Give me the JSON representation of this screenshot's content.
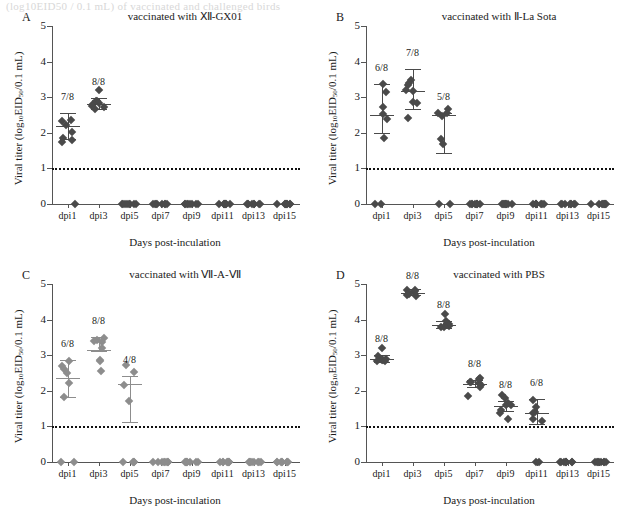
{
  "figure": {
    "caption_strip": "(log10EID50 / 0.1 mL) of vaccinated and challenged birds",
    "width": 628,
    "height": 523
  },
  "axes": {
    "ylabel_prefix": "Viral titer (log",
    "ylabel_sub1": "10",
    "ylabel_mid": "EID",
    "ylabel_sub2": "50",
    "ylabel_suffix": "/0.1 mL)",
    "ylabel_full": "Viral titer (log10EID50/0.1 mL)",
    "xlabel": "Days post-inculation",
    "y_ticks": [
      "0",
      "1",
      "2",
      "3",
      "4",
      "5"
    ],
    "y_min": 0,
    "y_max": 5,
    "x_categories": [
      "dpi1",
      "dpi3",
      "dpi5",
      "dpi7",
      "dpi9",
      "dpi11",
      "dpi13",
      "dpi15"
    ],
    "threshold_value": 1,
    "threshold_style": "dotted"
  },
  "colors": {
    "axis": "#555555",
    "threshold": "#111111",
    "marker_dark": "#4a4a4a",
    "marker_light": "#8d8d8d",
    "text": "#1a1a1a"
  },
  "chart_data": {
    "type": "scatter",
    "xlabel": "Days post-inculation",
    "ylabel": "Viral titer (log10EID50/0.1 mL)",
    "ylim": [
      0,
      5
    ],
    "grid": false,
    "legend": "none",
    "x_categories": [
      "dpi1",
      "dpi3",
      "dpi5",
      "dpi7",
      "dpi9",
      "dpi11",
      "dpi13",
      "dpi15"
    ],
    "threshold_line": {
      "value": 1,
      "style": "dotted",
      "label": "limit of detection"
    },
    "panels": [
      {
        "letter": "A",
        "title": "vaccinated with Ⅻ-GX01",
        "marker_color": "#4a4a4a",
        "groups": [
          {
            "x": "dpi1",
            "n_positive_label": "7/8",
            "mean": 2.18,
            "err_low": 1.82,
            "err_high": 2.56,
            "values": [
              2.38,
              2.35,
              2.18,
              2.0,
              1.85,
              1.83,
              1.72,
              0.0
            ]
          },
          {
            "x": "dpi3",
            "n_positive_label": "8/8",
            "mean": 2.82,
            "err_low": 2.68,
            "err_high": 2.98,
            "values": [
              3.18,
              2.88,
              2.86,
              2.84,
              2.8,
              2.78,
              2.72,
              2.68
            ]
          },
          {
            "x": "dpi5",
            "n_positive_label": "",
            "values": [
              0,
              0,
              0,
              0,
              0,
              0,
              0,
              0
            ]
          },
          {
            "x": "dpi7",
            "n_positive_label": "",
            "values": [
              0,
              0,
              0,
              0,
              0,
              0,
              0,
              0
            ]
          },
          {
            "x": "dpi9",
            "n_positive_label": "",
            "values": [
              0,
              0,
              0,
              0,
              0,
              0,
              0,
              0
            ]
          },
          {
            "x": "dpi11",
            "n_positive_label": "",
            "values": [
              0,
              0,
              0,
              0,
              0,
              0,
              0,
              0
            ]
          },
          {
            "x": "dpi13",
            "n_positive_label": "",
            "values": [
              0,
              0,
              0,
              0,
              0,
              0,
              0,
              0
            ]
          },
          {
            "x": "dpi15",
            "n_positive_label": "",
            "values": [
              0,
              0,
              0,
              0,
              0,
              0,
              0,
              0
            ]
          }
        ]
      },
      {
        "letter": "B",
        "title": "vaccinated with Ⅱ-La Sota",
        "marker_color": "#4a4a4a",
        "groups": [
          {
            "x": "dpi1",
            "n_positive_label": "6/8",
            "mean": 2.5,
            "err_low": 2.0,
            "err_high": 3.38,
            "values": [
              3.38,
              3.18,
              2.7,
              2.52,
              2.4,
              1.85,
              0.0,
              0.0
            ]
          },
          {
            "x": "dpi3",
            "n_positive_label": "7/8",
            "mean": 3.18,
            "err_low": 2.67,
            "err_high": 3.8,
            "values": [
              3.5,
              3.38,
              3.33,
              3.22,
              3.18,
              2.86,
              2.84,
              2.4
            ]
          },
          {
            "x": "dpi5",
            "n_positive_label": "5/8",
            "mean": 2.5,
            "err_low": 1.42,
            "err_high": 2.56,
            "values": [
              2.7,
              2.55,
              2.52,
              2.5,
              1.85,
              1.7,
              0.0,
              0.0
            ]
          },
          {
            "x": "dpi7",
            "n_positive_label": "",
            "values": [
              0,
              0,
              0,
              0,
              0,
              0,
              0,
              0
            ]
          },
          {
            "x": "dpi9",
            "n_positive_label": "",
            "values": [
              0,
              0,
              0,
              0,
              0,
              0,
              0,
              0
            ]
          },
          {
            "x": "dpi11",
            "n_positive_label": "",
            "values": [
              0,
              0,
              0,
              0,
              0,
              0,
              0,
              0
            ]
          },
          {
            "x": "dpi13",
            "n_positive_label": "",
            "values": [
              0,
              0,
              0,
              0,
              0,
              0,
              0,
              0
            ]
          },
          {
            "x": "dpi15",
            "n_positive_label": "",
            "values": [
              0,
              0,
              0,
              0,
              0,
              0,
              0,
              0
            ]
          }
        ]
      },
      {
        "letter": "C",
        "title": "vaccinated with Ⅶ-A-Ⅶ",
        "marker_color": "#8d8d8d",
        "groups": [
          {
            "x": "dpi1",
            "n_positive_label": "6/8",
            "mean": 2.35,
            "err_low": 1.83,
            "err_high": 2.86,
            "values": [
              2.86,
              2.7,
              2.63,
              2.48,
              2.2,
              1.85,
              0.0,
              0.0
            ]
          },
          {
            "x": "dpi3",
            "n_positive_label": "8/8",
            "mean": 3.15,
            "err_low": 3.12,
            "err_high": 3.5,
            "values": [
              3.5,
              3.45,
              3.42,
              3.38,
              3.2,
              2.88,
              2.85,
              2.52
            ]
          },
          {
            "x": "dpi5",
            "n_positive_label": "4/8",
            "mean": 2.2,
            "err_low": 1.13,
            "err_high": 2.42,
            "values": [
              2.72,
              2.52,
              2.2,
              1.7,
              0.0,
              0.0,
              0.0,
              0.0
            ]
          },
          {
            "x": "dpi7",
            "n_positive_label": "",
            "values": [
              0,
              0,
              0,
              0,
              0,
              0,
              0,
              0
            ]
          },
          {
            "x": "dpi9",
            "n_positive_label": "",
            "values": [
              0,
              0,
              0,
              0,
              0,
              0,
              0,
              0
            ]
          },
          {
            "x": "dpi11",
            "n_positive_label": "",
            "values": [
              0,
              0,
              0,
              0,
              0,
              0,
              0,
              0
            ]
          },
          {
            "x": "dpi13",
            "n_positive_label": "",
            "values": [
              0,
              0,
              0,
              0,
              0,
              0,
              0,
              0
            ]
          },
          {
            "x": "dpi15",
            "n_positive_label": "",
            "values": [
              0,
              0,
              0,
              0,
              0,
              0,
              0,
              0
            ]
          }
        ]
      },
      {
        "letter": "D",
        "title": "vaccinated with PBS",
        "marker_color": "#4a4a4a",
        "groups": [
          {
            "x": "dpi1",
            "n_positive_label": "8/8",
            "mean": 2.88,
            "err_low": 2.82,
            "err_high": 3.0,
            "values": [
              3.18,
              3.0,
              2.92,
              2.9,
              2.88,
              2.86,
              2.84,
              2.82
            ]
          },
          {
            "x": "dpi3",
            "n_positive_label": "8/8",
            "mean": 4.76,
            "err_low": 4.68,
            "err_high": 4.86,
            "values": [
              4.86,
              4.82,
              4.8,
              4.78,
              4.76,
              4.72,
              4.7,
              4.68
            ]
          },
          {
            "x": "dpi5",
            "n_positive_label": "8/8",
            "mean": 3.86,
            "err_low": 3.76,
            "err_high": 3.96,
            "values": [
              4.18,
              3.95,
              3.9,
              3.88,
              3.86,
              3.82,
              3.8,
              3.76
            ]
          },
          {
            "x": "dpi7",
            "n_positive_label": "8/8",
            "mean": 2.2,
            "err_low": 2.12,
            "err_high": 2.3,
            "values": [
              2.38,
              2.32,
              2.28,
              2.22,
              2.2,
              2.16,
              2.12,
              1.85
            ]
          },
          {
            "x": "dpi9",
            "n_positive_label": "8/8",
            "mean": 1.58,
            "err_low": 1.42,
            "err_high": 1.72,
            "values": [
              1.88,
              1.78,
              1.68,
              1.62,
              1.58,
              1.48,
              1.4,
              1.18
            ]
          },
          {
            "x": "dpi11",
            "n_positive_label": "6/8",
            "mean": 1.38,
            "err_low": 1.08,
            "err_high": 1.78,
            "values": [
              1.72,
              1.52,
              1.42,
              1.38,
              1.22,
              1.15,
              0.0,
              0.0
            ]
          },
          {
            "x": "dpi13",
            "n_positive_label": "",
            "values": [
              0,
              0,
              0,
              0,
              0,
              0,
              0,
              0
            ]
          },
          {
            "x": "dpi15",
            "n_positive_label": "",
            "values": [
              0,
              0,
              0,
              0,
              0,
              0,
              0,
              0
            ]
          }
        ]
      }
    ]
  }
}
